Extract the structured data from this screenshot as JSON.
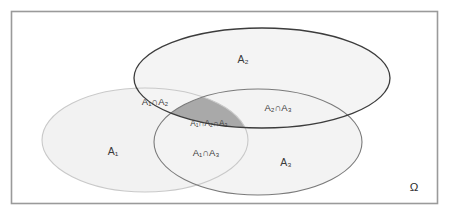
{
  "diagram": {
    "type": "venn-3-set",
    "universe_label": "Ω",
    "sets": [
      {
        "id": "A1",
        "label": "A₁",
        "label_base": "A",
        "label_sub": "1"
      },
      {
        "id": "A2",
        "label": "A₂",
        "label_base": "A",
        "label_sub": "2"
      },
      {
        "id": "A3",
        "label": "A₃",
        "label_base": "A",
        "label_sub": "3"
      }
    ],
    "regions": {
      "a1_only": "A₁",
      "a2_only": "A₂",
      "a3_only": "A₃",
      "a1_a2": "A₁∩A₂",
      "a2_a3": "A₂∩A₃",
      "a1_a3": "A₁∩A₃",
      "a1_a2_a3": "A₁∩A₂∩A₃"
    },
    "colors": {
      "frame_stroke": "#9a9a9a",
      "a1_stroke": "#c9c9c9",
      "a2_stroke": "#3c3c3c",
      "a3_stroke": "#7a7a7a",
      "a1_fill": "#f2f2f2",
      "a2_fill": "#f4f4f4",
      "a3_fill": "#f3f3f3",
      "triple_fill": "#a9a9a9",
      "background": "#ffffff",
      "text": "#3a3a3a"
    }
  }
}
